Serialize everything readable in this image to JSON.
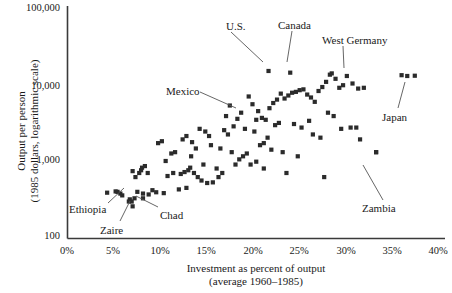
{
  "chart_data": {
    "type": "scatter",
    "title": "",
    "xlabel": "Investment as percent of output (average 1960–1985)",
    "xlabel_line1": "Investment as percent of output",
    "xlabel_line2": "(average 1960–1985)",
    "ylabel": "Output per person (1985 dollars, logarithmic scale)",
    "ylabel_line1": "Output per person",
    "ylabel_line2": "(1985 dollars, logarithmic scale)",
    "xlim": [
      0,
      40
    ],
    "ylim": [
      100,
      100000
    ],
    "yscale": "log",
    "grid": false,
    "legend": "none",
    "marker": "square",
    "marker_color": "#2b2b2b",
    "xticks": [
      "0%",
      "5%",
      "10%",
      "15%",
      "20%",
      "25%",
      "30%",
      "35%",
      "40%"
    ],
    "xtick_values": [
      0,
      5,
      10,
      15,
      20,
      25,
      30,
      35,
      40
    ],
    "yticks": [
      "100",
      "1,000",
      "10,000",
      "100,000"
    ],
    "ytick_values": [
      100,
      1000,
      10000,
      100000
    ],
    "annotations": [
      {
        "label": "U.S.",
        "x": 21.3,
        "y": 14500,
        "label_x": 226,
        "label_y": 21,
        "line": [
          231,
          32,
          263,
          62
        ]
      },
      {
        "label": "Canada",
        "x": 23.6,
        "y": 13800,
        "label_x": 278,
        "label_y": 20,
        "line": [
          292,
          31,
          287,
          62
        ]
      },
      {
        "label": "West Germany",
        "x": 28.0,
        "y": 13500,
        "label_x": 322,
        "label_y": 35,
        "line": [
          343,
          46,
          344,
          68
        ]
      },
      {
        "label": "Japan",
        "x": 36.0,
        "y": 12500,
        "label_x": 382,
        "label_y": 112,
        "line": [
          398,
          108,
          405,
          82
        ]
      },
      {
        "label": "Mexico",
        "x": 20.0,
        "y": 3400,
        "label_x": 166,
        "label_y": 86,
        "line": [
          200,
          92,
          236,
          108
        ]
      },
      {
        "label": "Ethiopia",
        "x": 5.3,
        "y": 400,
        "label_x": 69,
        "label_y": 204,
        "line": [
          108,
          203,
          124,
          188
        ]
      },
      {
        "label": "Zaire",
        "x": 6.8,
        "y": 300,
        "label_x": 100,
        "label_y": 225,
        "line": [
          120,
          221,
          130,
          201
        ]
      },
      {
        "label": "Chad",
        "x": 8.0,
        "y": 330,
        "label_x": 160,
        "label_y": 210,
        "line": [
          158,
          207,
          136,
          196
        ]
      },
      {
        "label": "Zambia",
        "x": 32.7,
        "y": 1300,
        "label_x": 362,
        "label_y": 203,
        "line": [
          383,
          200,
          363,
          165
        ]
      }
    ],
    "points": [
      {
        "x": 4.2,
        "y": 390
      },
      {
        "x": 5.1,
        "y": 405
      },
      {
        "x": 5.6,
        "y": 380
      },
      {
        "x": 5.8,
        "y": 360
      },
      {
        "x": 6.5,
        "y": 300
      },
      {
        "x": 6.6,
        "y": 320
      },
      {
        "x": 6.9,
        "y": 260
      },
      {
        "x": 7.1,
        "y": 330
      },
      {
        "x": 7.4,
        "y": 400
      },
      {
        "x": 8.0,
        "y": 380
      },
      {
        "x": 8.6,
        "y": 370
      },
      {
        "x": 9.4,
        "y": 395
      },
      {
        "x": 10.2,
        "y": 385
      },
      {
        "x": 10.6,
        "y": 640
      },
      {
        "x": 11.2,
        "y": 700
      },
      {
        "x": 12.0,
        "y": 680
      },
      {
        "x": 12.4,
        "y": 720
      },
      {
        "x": 12.8,
        "y": 760
      },
      {
        "x": 13.0,
        "y": 820
      },
      {
        "x": 13.4,
        "y": 700
      },
      {
        "x": 13.8,
        "y": 620
      },
      {
        "x": 14.2,
        "y": 560
      },
      {
        "x": 14.8,
        "y": 520
      },
      {
        "x": 15.4,
        "y": 530
      },
      {
        "x": 16.0,
        "y": 620
      },
      {
        "x": 7.6,
        "y": 700
      },
      {
        "x": 7.8,
        "y": 760
      },
      {
        "x": 7.9,
        "y": 820
      },
      {
        "x": 8.2,
        "y": 860
      },
      {
        "x": 8.5,
        "y": 700
      },
      {
        "x": 6.9,
        "y": 740
      },
      {
        "x": 7.2,
        "y": 620
      },
      {
        "x": 10.4,
        "y": 1000
      },
      {
        "x": 9.6,
        "y": 1700
      },
      {
        "x": 10.0,
        "y": 1800
      },
      {
        "x": 11.4,
        "y": 1300
      },
      {
        "x": 12.2,
        "y": 1900
      },
      {
        "x": 12.6,
        "y": 2100
      },
      {
        "x": 13.2,
        "y": 1750
      },
      {
        "x": 13.6,
        "y": 1450
      },
      {
        "x": 14.0,
        "y": 2600
      },
      {
        "x": 14.6,
        "y": 2400
      },
      {
        "x": 15.0,
        "y": 2100
      },
      {
        "x": 15.2,
        "y": 1600
      },
      {
        "x": 16.2,
        "y": 1450
      },
      {
        "x": 16.6,
        "y": 2500
      },
      {
        "x": 17.0,
        "y": 2200
      },
      {
        "x": 17.4,
        "y": 1300
      },
      {
        "x": 17.8,
        "y": 900
      },
      {
        "x": 18.2,
        "y": 1050
      },
      {
        "x": 18.6,
        "y": 1150
      },
      {
        "x": 19.0,
        "y": 1250
      },
      {
        "x": 19.4,
        "y": 900
      },
      {
        "x": 20.0,
        "y": 980
      },
      {
        "x": 20.4,
        "y": 1600
      },
      {
        "x": 20.8,
        "y": 1700
      },
      {
        "x": 21.2,
        "y": 2000
      },
      {
        "x": 16.8,
        "y": 3800
      },
      {
        "x": 17.2,
        "y": 5200
      },
      {
        "x": 18.0,
        "y": 3500
      },
      {
        "x": 18.4,
        "y": 4200
      },
      {
        "x": 19.2,
        "y": 6800
      },
      {
        "x": 19.6,
        "y": 5400
      },
      {
        "x": 20.2,
        "y": 4400
      },
      {
        "x": 20.6,
        "y": 3600
      },
      {
        "x": 21.0,
        "y": 3400
      },
      {
        "x": 21.4,
        "y": 4800
      },
      {
        "x": 21.8,
        "y": 5600
      },
      {
        "x": 22.2,
        "y": 6200
      },
      {
        "x": 22.6,
        "y": 7400
      },
      {
        "x": 23.0,
        "y": 6400
      },
      {
        "x": 23.4,
        "y": 7000
      },
      {
        "x": 23.8,
        "y": 7600
      },
      {
        "x": 24.2,
        "y": 7800
      },
      {
        "x": 24.6,
        "y": 8200
      },
      {
        "x": 25.0,
        "y": 8400
      },
      {
        "x": 25.4,
        "y": 7200
      },
      {
        "x": 25.8,
        "y": 6600
      },
      {
        "x": 26.2,
        "y": 5800
      },
      {
        "x": 26.6,
        "y": 8000
      },
      {
        "x": 27.0,
        "y": 9000
      },
      {
        "x": 27.4,
        "y": 10500
      },
      {
        "x": 27.8,
        "y": 13000
      },
      {
        "x": 28.4,
        "y": 11500
      },
      {
        "x": 28.8,
        "y": 8800
      },
      {
        "x": 29.2,
        "y": 9500
      },
      {
        "x": 29.6,
        "y": 12500
      },
      {
        "x": 30.2,
        "y": 10000
      },
      {
        "x": 30.8,
        "y": 8600
      },
      {
        "x": 31.4,
        "y": 8800
      },
      {
        "x": 35.4,
        "y": 12800
      },
      {
        "x": 36.8,
        "y": 12600
      },
      {
        "x": 22.0,
        "y": 2900
      },
      {
        "x": 22.4,
        "y": 3100
      },
      {
        "x": 24.0,
        "y": 3000
      },
      {
        "x": 24.8,
        "y": 2700
      },
      {
        "x": 25.6,
        "y": 3300
      },
      {
        "x": 26.0,
        "y": 2200
      },
      {
        "x": 26.8,
        "y": 2000
      },
      {
        "x": 27.6,
        "y": 4200
      },
      {
        "x": 28.2,
        "y": 3800
      },
      {
        "x": 29.0,
        "y": 2600
      },
      {
        "x": 30.0,
        "y": 2700
      },
      {
        "x": 30.6,
        "y": 2700
      },
      {
        "x": 31.0,
        "y": 1900
      },
      {
        "x": 32.7,
        "y": 1300
      },
      {
        "x": 17.6,
        "y": 2800
      },
      {
        "x": 18.8,
        "y": 2600
      },
      {
        "x": 19.8,
        "y": 2400
      },
      {
        "x": 21.6,
        "y": 1400
      },
      {
        "x": 22.8,
        "y": 1300
      },
      {
        "x": 24.4,
        "y": 1150
      },
      {
        "x": 20.8,
        "y": 800
      },
      {
        "x": 23.2,
        "y": 700
      },
      {
        "x": 27.2,
        "y": 620
      },
      {
        "x": 11.8,
        "y": 430
      },
      {
        "x": 12.6,
        "y": 450
      },
      {
        "x": 9.0,
        "y": 420
      },
      {
        "x": 16.4,
        "y": 700
      },
      {
        "x": 15.8,
        "y": 800
      },
      {
        "x": 14.4,
        "y": 900
      },
      {
        "x": 13.1,
        "y": 1150
      },
      {
        "x": 11.0,
        "y": 1250
      }
    ]
  }
}
